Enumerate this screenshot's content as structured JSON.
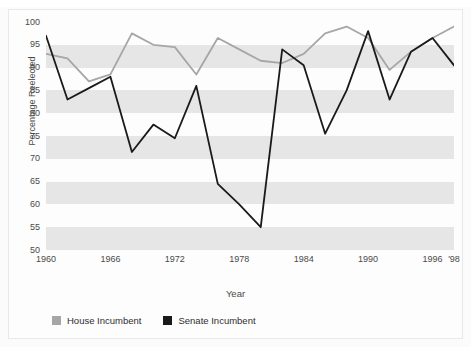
{
  "figure": {
    "cut_off_caption": "",
    "background": "#fbfbfb",
    "border_color": "#e9e9e9"
  },
  "axes": {
    "ylabel": "Percentage Reelected",
    "xlabel": "Year",
    "yticks": [
      "100",
      "95",
      "90",
      "85",
      "80",
      "75",
      "70",
      "65",
      "60",
      "55",
      "50"
    ],
    "xticks": [
      "1960",
      "1966",
      "1972",
      "1978",
      "1984",
      "1990",
      "1996",
      "'98"
    ]
  },
  "legend": {
    "items": [
      {
        "label": "House Incumbent",
        "color": "#a6a6a6"
      },
      {
        "label": "Senate Incumbent",
        "color": "#1a1a1a"
      }
    ]
  },
  "chart_data": {
    "type": "line",
    "title": "",
    "xlabel": "Year",
    "ylabel": "Percentage Reelected",
    "xlim": [
      1960,
      1998
    ],
    "ylim": [
      50,
      100
    ],
    "ytick_values": [
      100,
      95,
      90,
      85,
      80,
      75,
      70,
      65,
      60,
      55,
      50
    ],
    "xtick_values": [
      1960,
      1966,
      1972,
      1978,
      1984,
      1990,
      1996,
      1998
    ],
    "xtick_labels": [
      "1960",
      "1966",
      "1972",
      "1978",
      "1984",
      "1990",
      "1996",
      "'98"
    ],
    "grid": "horizontal alternating gray bands",
    "legend_position": "below plot, left aligned",
    "x": [
      1960,
      1962,
      1964,
      1966,
      1968,
      1970,
      1972,
      1974,
      1976,
      1978,
      1980,
      1982,
      1984,
      1986,
      1988,
      1990,
      1992,
      1994,
      1996,
      1998
    ],
    "series": [
      {
        "name": "House Incumbent",
        "color": "#a6a6a6",
        "values": [
          93.0,
          92.0,
          87.0,
          88.5,
          97.5,
          95.0,
          94.5,
          88.5,
          96.5,
          94.0,
          91.5,
          91.0,
          93.0,
          97.5,
          99.0,
          96.5,
          89.5,
          93.5,
          96.5,
          99.0
        ]
      },
      {
        "name": "Senate Incumbent",
        "color": "#1a1a1a",
        "values": [
          97.0,
          83.0,
          85.5,
          88.0,
          71.5,
          77.5,
          74.5,
          86.0,
          64.5,
          60.0,
          55.0,
          94.0,
          90.5,
          75.5,
          85.0,
          98.0,
          83.0,
          93.5,
          96.5,
          90.5
        ]
      }
    ]
  }
}
